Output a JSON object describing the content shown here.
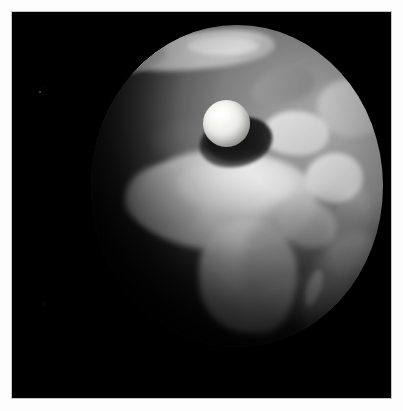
{
  "image": {
    "kind": "natural-image",
    "subject": "Earth seen from space with a floating white sphere",
    "caption": "Grayscale render of the Earth's Africa-facing hemisphere against black space, with a bright white sphere in front of it casting a dark elliptical shadow onto the planet.",
    "orientation": "portrait",
    "width_px": "403",
    "height_px": "411"
  },
  "frame": {
    "style": "white photographic border",
    "border_color": "#fdfdfd",
    "border_width_px": "13",
    "inner_edge_color": "#9a9a9a"
  },
  "space": {
    "background_color": "#000000",
    "label": "black space background",
    "specks": [
      {
        "name": "speck-1"
      },
      {
        "name": "speck-2"
      },
      {
        "name": "speck-3"
      },
      {
        "name": "speck-4"
      },
      {
        "name": "speck-5"
      }
    ]
  },
  "earth": {
    "label": "Earth globe",
    "center_x_px": "224",
    "center_y_px": "186",
    "radius_x_px": "146",
    "radius_y_px": "161",
    "ocean_color": "#6f6f6f",
    "land_color": "#d8d8d8",
    "shadow_color": "#000000",
    "lighting": "sunlight from upper right, terminator across the left limb",
    "features": [
      {
        "name": "arctic-ice-cap",
        "label": "Arctic ice cap"
      },
      {
        "name": "greenland",
        "label": "Greenland"
      },
      {
        "name": "arctic-islands",
        "label": "Arctic islands"
      },
      {
        "name": "scandinavia",
        "label": "Scandinavia"
      },
      {
        "name": "europe",
        "label": "Europe"
      },
      {
        "name": "asia",
        "label": "Western Asia"
      },
      {
        "name": "sahara",
        "label": "Sahara desert"
      },
      {
        "name": "north-africa",
        "label": "North Africa"
      },
      {
        "name": "west-africa",
        "label": "West Africa"
      },
      {
        "name": "southern-africa",
        "label": "Southern Africa"
      },
      {
        "name": "horn-of-africa",
        "label": "Horn of Africa"
      },
      {
        "name": "arabian-peninsula",
        "label": "Arabian Peninsula"
      },
      {
        "name": "madagascar",
        "label": "Madagascar"
      },
      {
        "name": "indian-ocean",
        "label": "Indian Ocean"
      }
    ],
    "clouds": [
      {
        "name": "cloud-band-indian-ocean"
      },
      {
        "name": "cloud-band-arabian-sea"
      },
      {
        "name": "cloud-band-south-atlantic"
      },
      {
        "name": "cloud-band-north-atlantic"
      }
    ]
  },
  "sphere": {
    "label": "floating white sphere",
    "center_x_px": "213",
    "center_y_px": "110",
    "radius_px": "23",
    "highlight_color": "#ffffff",
    "body_color": "#ebebe8",
    "terminator_color": "#9a9a96"
  },
  "cast_shadow": {
    "label": "shadow cast by the sphere onto Earth",
    "center_x_px": "180",
    "center_y_px": "129",
    "color": "#000000"
  }
}
